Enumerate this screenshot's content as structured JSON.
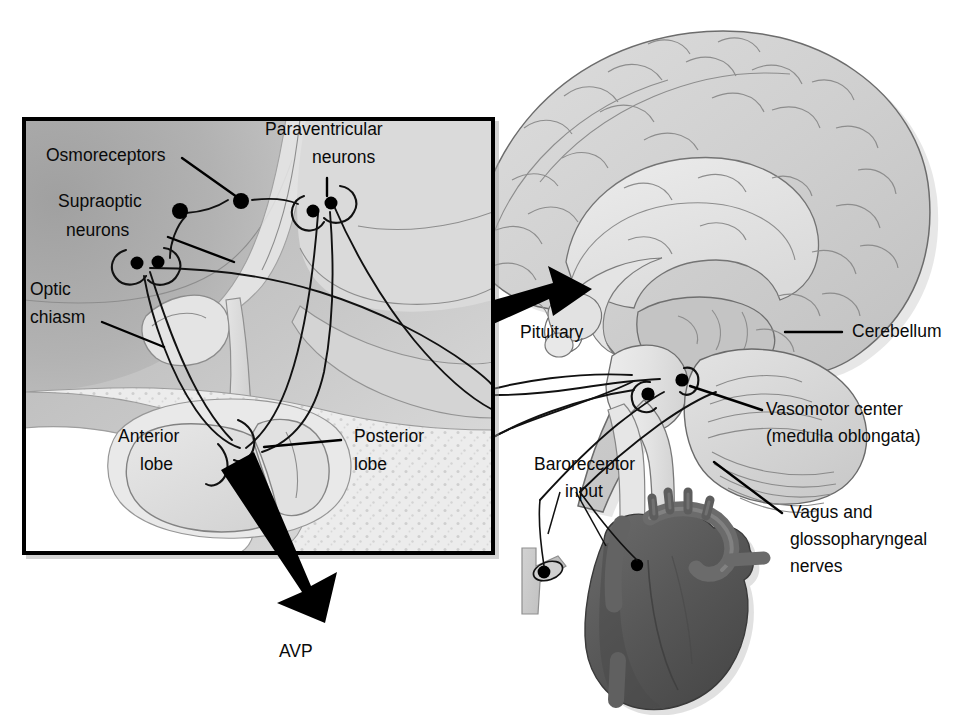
{
  "figure": {
    "background_color": "#ffffff",
    "inset_box": {
      "name": "hypothalamus-pituitary-inset",
      "border_color": "#000000",
      "fill_color": "#d2d2d2",
      "x": 22,
      "y": 117,
      "width": 473,
      "height": 438
    }
  },
  "labels": {
    "osmoreceptors": "Osmoreceptors",
    "supraoptic_neurons_line1": "Supraoptic",
    "supraoptic_neurons_line2": "neurons",
    "paraventricular_neurons_line1": "Paraventricular",
    "paraventricular_neurons_line2": "neurons",
    "optic_chiasm_line1": "Optic",
    "optic_chiasm_line2": "chiasm",
    "anterior_lobe_line1": "Anterior",
    "anterior_lobe_line2": "lobe",
    "posterior_lobe_line1": "Posterior",
    "posterior_lobe_line2": "lobe",
    "avp": "AVP",
    "pituitary": "Pituitary",
    "cerebellum": "Cerebellum",
    "vasomotor_center_line1": "Vasomotor center",
    "vasomotor_center_line2": "(medulla oblongata)",
    "baroreceptor_input_line1": "Baroreceptor",
    "baroreceptor_input_line2": "input",
    "vagus_nerves_line1": "Vagus and",
    "vagus_nerves_line2": "glossopharyngeal",
    "vagus_nerves_line3": "nerves"
  },
  "colors": {
    "ink": "#0a0a0a",
    "box_border": "#000000",
    "inset_brain_tissue": "#bdbdbd",
    "inset_dark_tissue": "#a8a8a8",
    "inset_light_tissue": "#dcdcdc",
    "bone_stipple": "#e9e9e9",
    "sinus_white": "#ffffff",
    "brain_fill": "#d6d6d6",
    "brain_light": "#e8e8e8",
    "brainstem_fill": "#e0e0e0",
    "heart_fill": "#595959",
    "heart_dark": "#4a4a4a",
    "heart_light": "#6e6e6e",
    "artery_fill": "#c9c9c9",
    "arrow_black": "#000000"
  },
  "anatomy": {
    "neuron_groups": [
      {
        "name": "supraoptic-neurons",
        "soma_count": 2
      },
      {
        "name": "paraventricular-neurons",
        "soma_count": 2
      },
      {
        "name": "osmoreceptor-cells",
        "soma_count": 2
      },
      {
        "name": "vasomotor-center-neurons",
        "soma_count": 2
      }
    ],
    "baroreceptor_sites": [
      "carotid-sinus",
      "aortic-arch"
    ],
    "black_arrows": [
      {
        "name": "avp-secretion-arrow",
        "direction": "down-right",
        "label": "AVP"
      },
      {
        "name": "pituitary-pointer-arrow",
        "direction": "up-right",
        "label": "Pituitary"
      }
    ]
  }
}
